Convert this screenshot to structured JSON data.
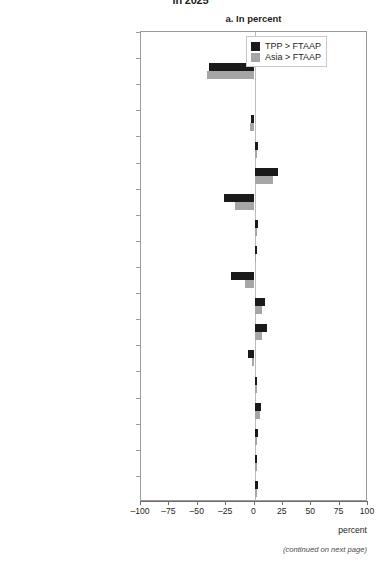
{
  "figure": {
    "top_title": "in 2025",
    "panel_title": "a. In percent",
    "footnote": "(continued on next page)",
    "axis_title": "percent"
  },
  "legend": {
    "position": "top-right",
    "entries": [
      {
        "label": "TPP > FTAAP",
        "color": "#1a1a1a"
      },
      {
        "label": "Asia > FTAAP",
        "color": "#a6a6a6"
      }
    ]
  },
  "chart_data": {
    "type": "bar",
    "orientation": "horizontal",
    "title": "a. In percent",
    "xlabel": "percent",
    "ylabel": "",
    "xlim": [
      -100,
      100
    ],
    "xticks": [
      -100,
      -75,
      -50,
      -25,
      0,
      25,
      50,
      75,
      100
    ],
    "xticklabels": [
      "–100",
      "–75",
      "–50",
      "–25",
      "0",
      "25",
      "50",
      "75",
      "100"
    ],
    "grid": false,
    "legend_position": "top-right",
    "categories": [
      "Rice",
      "Wheat",
      "Other agriculture",
      "Mining",
      "Food",
      "Textiles",
      "Apparel",
      "Chemicals",
      "Metals",
      "Electrical equipment",
      "Machinery",
      "Transportation equipment",
      "Other manufactures",
      "Utilities",
      "Construction",
      "Trade",
      "Private services",
      "Government services"
    ],
    "series": [
      {
        "name": "TPP > FTAAP",
        "color": "#1a1a1a",
        "values": [
          0,
          -40,
          0,
          -3,
          3,
          21,
          -27,
          3,
          2,
          -21,
          9,
          11,
          -6,
          2,
          6,
          3,
          2,
          3
        ]
      },
      {
        "name": "Asia > FTAAP",
        "color": "#a6a6a6",
        "values": [
          0,
          -42,
          0,
          -4,
          2,
          16,
          -17,
          2,
          1,
          -8,
          7,
          7,
          -2,
          2,
          5,
          2,
          2,
          2
        ]
      }
    ]
  }
}
